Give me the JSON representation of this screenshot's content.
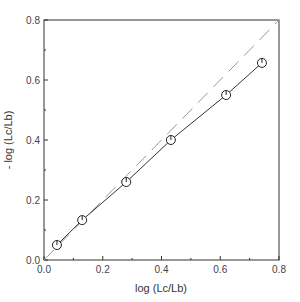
{
  "chart_data": {
    "type": "scatter",
    "title": "",
    "xlabel": "log (Lc/Lb)",
    "ylabel": "- log (Lc/Lb)",
    "xlim": [
      0.0,
      0.8
    ],
    "ylim": [
      0.0,
      0.8
    ],
    "x_ticks": [
      "0.0",
      "0.2",
      "0.4",
      "0.6",
      "0.8"
    ],
    "y_ticks": [
      "0.0",
      "0.2",
      "0.4",
      "0.6",
      "0.8"
    ],
    "x_tick_values": [
      0.0,
      0.2,
      0.4,
      0.6,
      0.8
    ],
    "y_tick_values": [
      0.0,
      0.2,
      0.4,
      0.6,
      0.8
    ],
    "minor_tick_values": [
      0.1,
      0.3,
      0.5,
      0.7
    ],
    "grid": false,
    "legend": null,
    "series": [
      {
        "name": "measured",
        "style": "solid line with open circle markers",
        "x": [
          0.044,
          0.13,
          0.28,
          0.432,
          0.62,
          0.742
        ],
        "y": [
          0.05,
          0.133,
          0.26,
          0.4,
          0.55,
          0.657
        ]
      },
      {
        "name": "1:1 reference",
        "style": "dashed line",
        "x": [
          0.0,
          0.8
        ],
        "y": [
          0.0,
          0.8
        ]
      }
    ],
    "colors": {
      "axis": "#333333",
      "data_line": "#333333",
      "reference_line": "#999999",
      "marker": "#222222"
    }
  }
}
